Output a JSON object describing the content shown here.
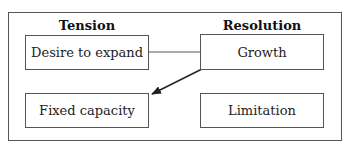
{
  "diagram": {
    "columns": [
      {
        "heading": "Tension"
      },
      {
        "heading": "Resolution"
      }
    ],
    "nodes": [
      {
        "id": "desire",
        "label": "Desire to expand",
        "column": "Tension",
        "row": 1
      },
      {
        "id": "growth",
        "label": "Growth",
        "column": "Resolution",
        "row": 1
      },
      {
        "id": "fixed",
        "label": "Fixed capacity",
        "column": "Tension",
        "row": 2
      },
      {
        "id": "limitation",
        "label": "Limitation",
        "column": "Resolution",
        "row": 2
      }
    ],
    "edges": [
      {
        "from": "desire",
        "to": "growth",
        "type": "line"
      },
      {
        "from": "growth",
        "to": "fixed",
        "type": "arrow"
      }
    ],
    "colors": {
      "stroke": "#555555",
      "text": "#222222",
      "background": "#ffffff"
    }
  }
}
